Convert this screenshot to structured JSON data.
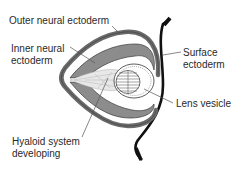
{
  "diagram": {
    "labels": {
      "outer_neural_ectoderm": "Outer neural ectoderm",
      "inner_neural_ectoderm_line1": "Inner neural",
      "inner_neural_ectoderm_line2": "ectoderm",
      "surface_ectoderm_line1": "Surface",
      "surface_ectoderm_line2": "ectoderm",
      "lens_vesicle": "Lens vesicle",
      "hyaloid_line1": "Hyaloid system",
      "hyaloid_line2": "developing"
    },
    "colors": {
      "outer_layer": "#6e6e6e",
      "inner_layer": "#8a8a8a",
      "surface_ectoderm": "#111111",
      "leader_lines": "#555555",
      "text": "#2a2a2a"
    }
  }
}
